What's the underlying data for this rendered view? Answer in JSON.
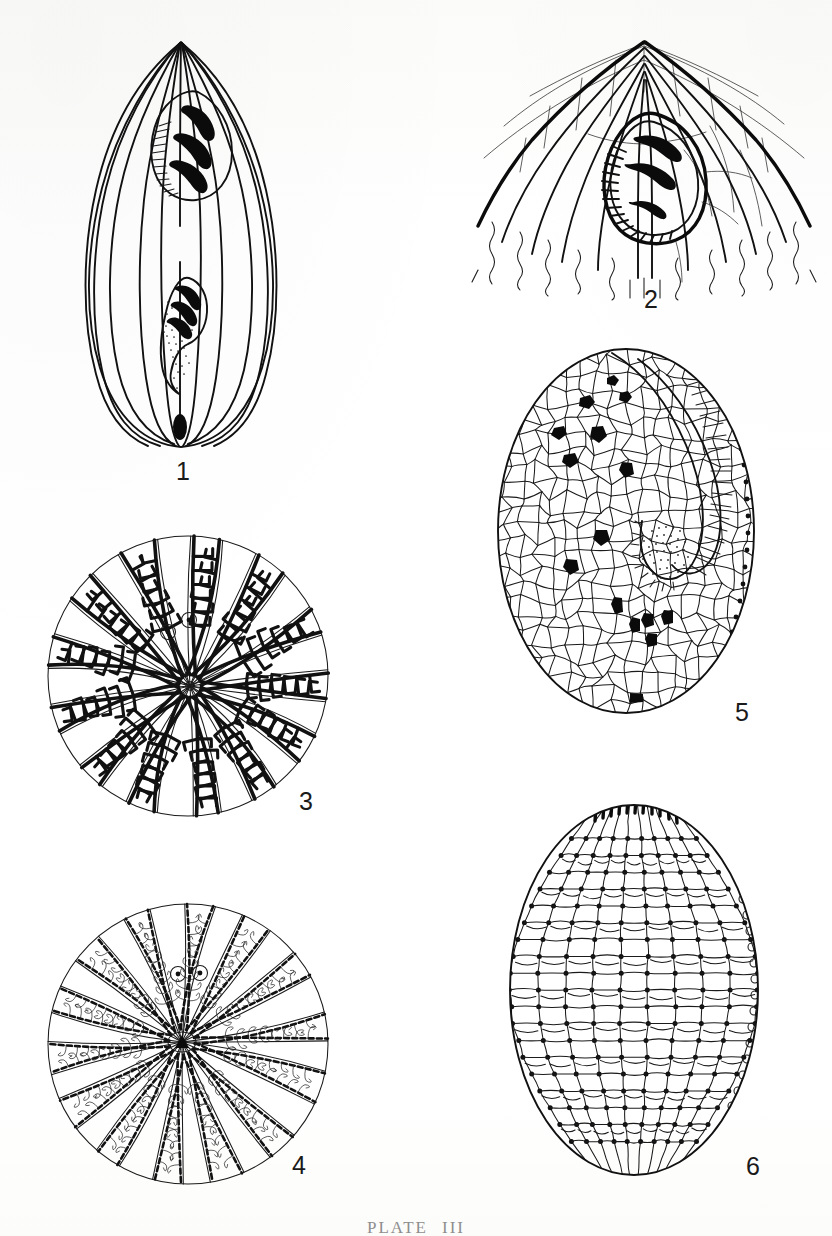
{
  "plate": {
    "caption_word": "PLATE",
    "caption_number": "III",
    "background_color": "#fdfdfc",
    "ink_color": "#111111",
    "width": 832,
    "height": 1236
  },
  "figures": [
    {
      "id": "figure-1",
      "label": "1",
      "subject": "ovate-test-ventral-view-with-two-apertures",
      "description": "Ovate pointed test in outline with longitudinal costae radiating from apex; two ornamented apertural structures on the median line and a small solid oval at the base.",
      "label_x": 176,
      "label_y": 459,
      "x": 40,
      "y": 30,
      "width": 300,
      "height": 420,
      "costae_count": 12,
      "aperture_count": 2,
      "aperture_bars": 3
    },
    {
      "id": "figure-2",
      "label": "2",
      "subject": "apical-region-enlarged-with-single-aperture",
      "description": "Enlarged apical region, broadly triangular, with heavy marginal costae, fine transverse sutures and one pyriform aperture bearing three heavy black bars and a comb of fine teeth.",
      "label_x": 644,
      "label_y": 287,
      "x": 470,
      "y": 30,
      "width": 350,
      "height": 250,
      "aperture_bars": 3
    },
    {
      "id": "figure-3",
      "label": "3",
      "subject": "circular-polar-view-coarse-radial-ribs",
      "description": "Circular polar view; about 26 coarse radial ribs with heavy comb-like lateral branches converging on an off-centre pole; two small ringed pores near the upper centre.",
      "label_x": 299,
      "label_y": 797,
      "x": 40,
      "y": 528,
      "width": 300,
      "height": 300,
      "ray_count": 26,
      "pore_count": 2
    },
    {
      "id": "figure-4",
      "label": "4",
      "subject": "circular-polar-view-fine-radial-ribs",
      "description": "Circular polar view; about 28 finer beaded radial ribs with slender hooked branchlets, a small dark solid centre, and two small ringed pores above the centre.",
      "label_x": 292,
      "label_y": 1163,
      "x": 40,
      "y": 898,
      "width": 300,
      "height": 300,
      "ray_count": 28,
      "pore_count": 2
    },
    {
      "id": "figure-5",
      "label": "5",
      "subject": "oval-test-reticulate-polygonal-plates",
      "description": "Oval test covered with irregular polygonal plates; a large curved sunken peristome runs from upper right to centre, fringed with fine combed striae, with scattered solid black plates over the surface and a row of small dots along the right margin.",
      "label_x": 735,
      "label_y": 715,
      "x": 492,
      "y": 345,
      "width": 300,
      "height": 390,
      "black_plate_count": 18
    },
    {
      "id": "figure-6",
      "label": "6",
      "subject": "oval-test-meridional-rows-of-tubercles",
      "description": "Oval test with meridional rows of rectangular plates; each plate boundary carries a small solid tubercle, a band of dark striae at the apex and a row of small circles along the right margin.",
      "label_x": 746,
      "label_y": 1166,
      "x": 500,
      "y": 795,
      "width": 300,
      "height": 390,
      "meridian_count": 9
    }
  ]
}
